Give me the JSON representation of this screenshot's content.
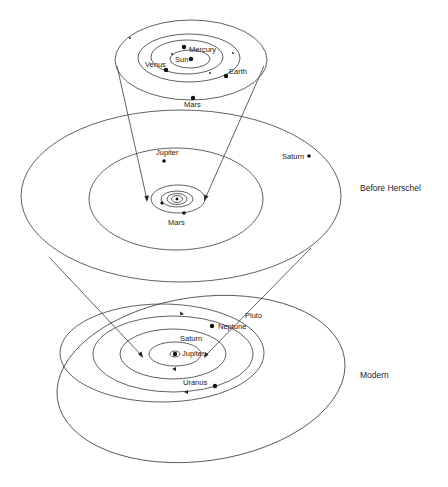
{
  "diagram": {
    "sections": [
      {
        "id": "inner",
        "labels": {
          "sun": "Sun",
          "mercury": "Mercury",
          "venus": "Venus",
          "earth": "Earth",
          "mars": "Mars"
        }
      },
      {
        "id": "before_herschel",
        "era_label": "Before Herschel",
        "labels": {
          "jupiter": "Jupiter",
          "saturn": "Saturn",
          "mars": "Mars"
        }
      },
      {
        "id": "modern",
        "era_label": "Modern",
        "labels": {
          "jupiter": "Jupiter",
          "saturn": "Saturn",
          "uranus": "Uranus",
          "neptune": "Neptune",
          "pluto": "Pluto"
        }
      }
    ],
    "colors": {
      "stroke": "#3a3a3a",
      "planet": "#111111",
      "background": "#ffffff"
    }
  }
}
